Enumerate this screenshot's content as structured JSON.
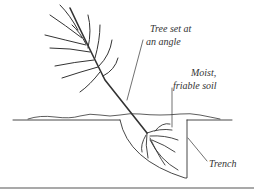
{
  "diagram": {
    "labels": {
      "tree_line1": "Tree set at",
      "tree_line2": "an angle",
      "soil_line1": "Moist,",
      "soil_line2": "friable soil",
      "trench": "Trench"
    },
    "colors": {
      "stroke": "#333333",
      "background": "#ffffff"
    }
  }
}
